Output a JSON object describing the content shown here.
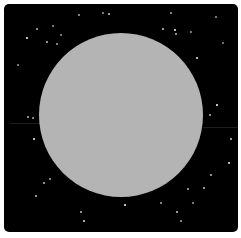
{
  "image": {
    "description": "Gray circular disc on a black star field",
    "background_color": "#000000",
    "disc": {
      "color": "#b4b4b4",
      "center_x": 121,
      "center_y": 115,
      "radius": 82
    },
    "stars": [
      {
        "x": 26,
        "y": 37,
        "b": 1.0
      },
      {
        "x": 36,
        "y": 28,
        "b": 0.6
      },
      {
        "x": 52,
        "y": 25,
        "b": 0.4
      },
      {
        "x": 46,
        "y": 41,
        "b": 0.6
      },
      {
        "x": 56,
        "y": 43,
        "b": 0.5
      },
      {
        "x": 60,
        "y": 34,
        "b": 0.4
      },
      {
        "x": 78,
        "y": 14,
        "b": 0.5
      },
      {
        "x": 108,
        "y": 13,
        "b": 0.7
      },
      {
        "x": 102,
        "y": 12,
        "b": 0.4
      },
      {
        "x": 170,
        "y": 12,
        "b": 0.5
      },
      {
        "x": 162,
        "y": 28,
        "b": 0.7
      },
      {
        "x": 174,
        "y": 29,
        "b": 1.0
      },
      {
        "x": 175,
        "y": 33,
        "b": 0.6
      },
      {
        "x": 190,
        "y": 31,
        "b": 0.4
      },
      {
        "x": 196,
        "y": 57,
        "b": 0.9
      },
      {
        "x": 215,
        "y": 16,
        "b": 0.4
      },
      {
        "x": 222,
        "y": 42,
        "b": 0.3
      },
      {
        "x": 17,
        "y": 64,
        "b": 0.4
      },
      {
        "x": 27,
        "y": 116,
        "b": 0.6
      },
      {
        "x": 32,
        "y": 117,
        "b": 0.5
      },
      {
        "x": 33,
        "y": 138,
        "b": 1.0
      },
      {
        "x": 216,
        "y": 104,
        "b": 1.0
      },
      {
        "x": 209,
        "y": 114,
        "b": 0.6
      },
      {
        "x": 230,
        "y": 138,
        "b": 0.7
      },
      {
        "x": 228,
        "y": 162,
        "b": 0.9
      },
      {
        "x": 210,
        "y": 174,
        "b": 0.6
      },
      {
        "x": 43,
        "y": 182,
        "b": 0.6
      },
      {
        "x": 49,
        "y": 178,
        "b": 0.5
      },
      {
        "x": 35,
        "y": 195,
        "b": 0.7
      },
      {
        "x": 124,
        "y": 204,
        "b": 1.0
      },
      {
        "x": 160,
        "y": 202,
        "b": 0.5
      },
      {
        "x": 187,
        "y": 188,
        "b": 0.6
      },
      {
        "x": 203,
        "y": 187,
        "b": 0.7
      },
      {
        "x": 192,
        "y": 202,
        "b": 0.4
      },
      {
        "x": 80,
        "y": 211,
        "b": 0.6
      },
      {
        "x": 83,
        "y": 220,
        "b": 0.8
      },
      {
        "x": 176,
        "y": 211,
        "b": 0.7
      },
      {
        "x": 180,
        "y": 220,
        "b": 0.5
      }
    ],
    "streaks": [
      {
        "x": 10,
        "y": 123,
        "w": 30
      },
      {
        "x": 203,
        "y": 127,
        "w": 35
      }
    ]
  }
}
